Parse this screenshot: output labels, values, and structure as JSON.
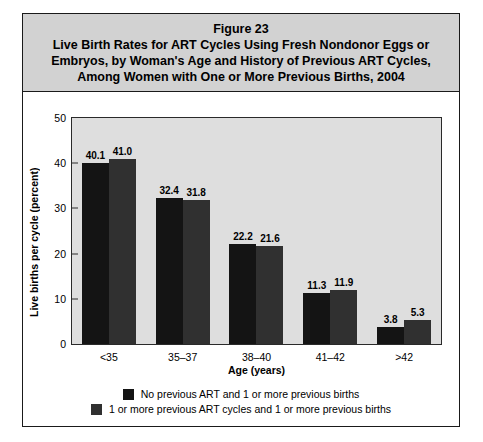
{
  "figure": {
    "number_label": "Figure 23",
    "title_lines": [
      "Figure 23",
      "Live Birth Rates for ART Cycles Using Fresh Nondonor Eggs or",
      "Embryos, by Woman's Age and History of Previous ART Cycles,",
      "Among Women with One or More Previous Births, 2004"
    ]
  },
  "colors": {
    "series_0": "#141414",
    "series_1": "#303030",
    "title_background": "#d2d2d2",
    "plot_background": "#dedede",
    "frame_border": "#1a1a1a"
  },
  "chart_data": {
    "type": "bar",
    "title": "Live Birth Rates for ART Cycles Using Fresh Nondonor Eggs or Embryos, by Woman's Age and History of Previous ART Cycles, Among Women with One or More Previous Births, 2004",
    "xlabel": "Age (years)",
    "ylabel": "Live births per cycle (percent)",
    "categories": [
      "<35",
      "35–37",
      "38–40",
      "41–42",
      ">42"
    ],
    "series": [
      {
        "name": "No previous ART and 1 or more previous births",
        "values": [
          40.1,
          41.0,
          22.2,
          11.3,
          3.8
        ]
      },
      {
        "name": "1 or more previous ART cycles and 1 or more previous births",
        "values": [
          41.0,
          31.8,
          21.6,
          11.9,
          5.3
        ]
      }
    ],
    "series_display": [
      {
        "name": "No previous ART and 1 or more previous births",
        "values": [
          40.1,
          32.4,
          22.2,
          11.3,
          3.8
        ],
        "labels": [
          "40.1",
          "32.4",
          "22.2",
          "11.3",
          "3.8"
        ]
      },
      {
        "name": "1 or more previous ART cycles and 1 or more previous births",
        "values": [
          41.0,
          31.8,
          21.6,
          11.9,
          5.3
        ],
        "labels": [
          "41.0",
          "31.8",
          "21.6",
          "11.9",
          "5.3"
        ]
      }
    ],
    "ylim": [
      0,
      50
    ],
    "yticks": [
      0,
      10,
      20,
      30,
      40,
      50
    ],
    "ytick_labels": [
      "0",
      "10",
      "20",
      "30",
      "40",
      "50"
    ],
    "grid": false,
    "legend_position": "bottom"
  },
  "legend": {
    "entries": [
      "No previous ART and 1 or more previous births",
      "1 or more previous ART cycles and 1 or more previous births"
    ]
  }
}
